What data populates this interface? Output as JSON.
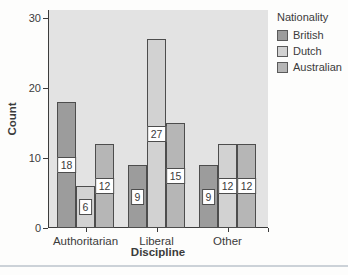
{
  "chart_data": {
    "type": "bar",
    "title": "",
    "categories": [
      "Authoritarian",
      "Liberal",
      "Other"
    ],
    "series": [
      {
        "name": "British",
        "color": "#9c9c9c",
        "values": [
          18,
          9,
          9
        ]
      },
      {
        "name": "Dutch",
        "color": "#d2d2d2",
        "values": [
          6,
          27,
          12
        ]
      },
      {
        "name": "Australian",
        "color": "#b6b6b6",
        "values": [
          12,
          15,
          12
        ]
      }
    ],
    "xlabel": "Discipline",
    "ylabel": "Count",
    "ylim": [
      0,
      30
    ],
    "yticks": [
      0,
      10,
      20,
      30
    ],
    "legend_title": "Nationality",
    "legend_position": "top-right",
    "grid": false,
    "bar_labels": true,
    "bar_label_style": "white box at bar mid-height",
    "plot_bg_color": "#e3e3e3",
    "bar_border_color": "#4d4d4d",
    "axis_color": "#3c3c3c",
    "text_color": "#3b3b3b",
    "page_rule_color": "#ccd2d8"
  }
}
